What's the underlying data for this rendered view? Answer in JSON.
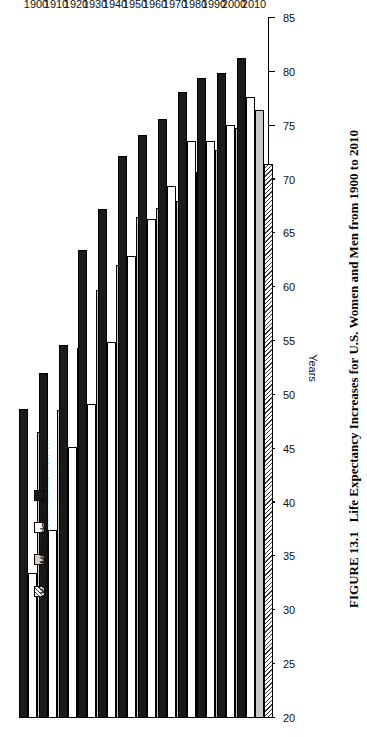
{
  "caption": {
    "number": "FIGURE 13.1",
    "text": "Life Expectancy Increases for U.S. Women and Men from 1900 to 2010"
  },
  "legend": {
    "position": "top-left-rotated",
    "items": [
      {
        "label": "White women",
        "key": "white_women",
        "swatch": "solid-black"
      },
      {
        "label": "Nonwhite women",
        "key": "nonwhite_women",
        "swatch": "solid-white"
      },
      {
        "label": "White men",
        "key": "white_men",
        "swatch": "solid-gray"
      },
      {
        "label": "Nonwhite men",
        "key": "nonwhite_men",
        "swatch": "diagonal-hatch"
      }
    ]
  },
  "chart_data": {
    "type": "bar",
    "orientation": "horizontal",
    "title": "Life Expectancy Increases for U.S. Women and Men from 1900 to 2010",
    "xlabel": "",
    "ylabel": "Years",
    "ylim": [
      20,
      85
    ],
    "yticks": [
      20,
      25,
      30,
      35,
      40,
      45,
      50,
      55,
      60,
      65,
      70,
      75,
      80,
      85
    ],
    "grid": false,
    "categories": [
      "1900",
      "1910",
      "1920",
      "1930",
      "1940",
      "1950",
      "1960",
      "1970",
      "1980",
      "1990",
      "2000",
      "2010"
    ],
    "series": [
      {
        "name": "White women",
        "values": [
          48.7,
          52.0,
          54.6,
          63.5,
          67.3,
          72.2,
          74.1,
          75.6,
          78.1,
          79.4,
          79.9,
          81.3
        ]
      },
      {
        "name": "Nonwhite women",
        "values": [
          33.5,
          37.5,
          45.2,
          49.2,
          54.9,
          62.9,
          66.3,
          69.4,
          73.6,
          73.6,
          75.1,
          77.7
        ]
      },
      {
        "name": "White men",
        "values": [
          46.6,
          48.6,
          54.4,
          59.7,
          62.1,
          66.5,
          67.4,
          68.0,
          70.7,
          72.7,
          74.8,
          76.5
        ]
      },
      {
        "name": "Nonwhite men",
        "values": [
          32.5,
          33.8,
          45.5,
          47.3,
          51.5,
          59.1,
          61.1,
          60.0,
          63.8,
          64.5,
          68.2,
          71.4
        ]
      }
    ]
  }
}
